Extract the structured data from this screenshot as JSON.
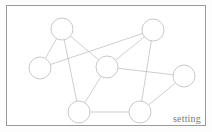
{
  "panel": {
    "caption": "setting",
    "border_color": "#9a9a9a",
    "background_color": "#ffffff"
  },
  "chart_data": {
    "type": "diagram",
    "subtype": "node-link-graph",
    "title": "",
    "node_radius": 11,
    "node_fill": "#ffffff",
    "node_stroke": "#b2b2b2",
    "edge_stroke": "#b9b9b9",
    "nodes": [
      {
        "id": "n1",
        "label": "",
        "x": 55,
        "y": 23
      },
      {
        "id": "n2",
        "label": "",
        "x": 146,
        "y": 24
      },
      {
        "id": "n3",
        "label": "",
        "x": 33,
        "y": 62
      },
      {
        "id": "n4",
        "label": "",
        "x": 100,
        "y": 61
      },
      {
        "id": "n5",
        "label": "",
        "x": 177,
        "y": 70
      },
      {
        "id": "n6",
        "label": "",
        "x": 72,
        "y": 106
      },
      {
        "id": "n7",
        "label": "",
        "x": 133,
        "y": 106
      }
    ],
    "edges": [
      {
        "source": "n1",
        "target": "n3"
      },
      {
        "source": "n1",
        "target": "n4"
      },
      {
        "source": "n1",
        "target": "n6"
      },
      {
        "source": "n3",
        "target": "n2"
      },
      {
        "source": "n2",
        "target": "n4"
      },
      {
        "source": "n2",
        "target": "n7"
      },
      {
        "source": "n4",
        "target": "n5"
      },
      {
        "source": "n4",
        "target": "n6"
      },
      {
        "source": "n5",
        "target": "n7"
      },
      {
        "source": "n6",
        "target": "n7"
      }
    ]
  }
}
